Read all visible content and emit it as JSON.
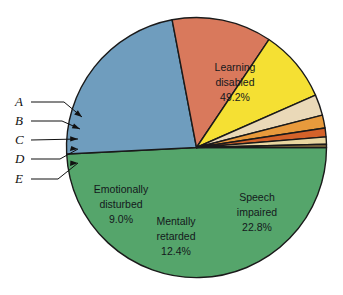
{
  "chart_data": {
    "type": "pie",
    "title": "",
    "subtitle": "",
    "xlabel": "",
    "ylabel": "",
    "legend_position": "callout-left",
    "grid": false,
    "units": "percent",
    "total": 100.0,
    "start_angle_deg": 0,
    "direction": "clockwise",
    "categories": [
      "Learning disabled",
      "Speech impaired",
      "Mentally retarded",
      "Emotionally disturbed",
      "E",
      "D",
      "C",
      "B",
      "A"
    ],
    "values": [
      49.2,
      22.8,
      12.4,
      9.0,
      2.6,
      1.6,
      1.1,
      0.9,
      0.4
    ],
    "colors": [
      "#55a56b",
      "#6f9dbe",
      "#d9795c",
      "#f5e033",
      "#ead9b8",
      "#e89a3c",
      "#d4622a",
      "#e8d6a0",
      "#8a7240"
    ],
    "slices": [
      {
        "id": "learning-disabled",
        "label": "Learning disabled",
        "label_line1": "Learning",
        "label_line2": "disabled",
        "value": 49.2,
        "value_label": "49.2%",
        "color": "#55a56b",
        "labeled_inside": true
      },
      {
        "id": "speech-impaired",
        "label": "Speech impaired",
        "label_line1": "Speech",
        "label_line2": "impaired",
        "value": 22.8,
        "value_label": "22.8%",
        "color": "#6f9dbe",
        "labeled_inside": true
      },
      {
        "id": "mentally-retarded",
        "label": "Mentally retarded",
        "label_line1": "Mentally",
        "label_line2": "retarded",
        "value": 12.4,
        "value_label": "12.4%",
        "color": "#d9795c",
        "labeled_inside": true
      },
      {
        "id": "emotionally-disturbed",
        "label": "Emotionally disturbed",
        "label_line1": "Emotionally",
        "label_line2": "disturbed",
        "value": 9.0,
        "value_label": "9.0%",
        "color": "#f5e033",
        "labeled_inside": true
      },
      {
        "id": "slice-e",
        "label": "E",
        "value": 2.6,
        "value_label": "",
        "color": "#ead9b8",
        "labeled_inside": false
      },
      {
        "id": "slice-d",
        "label": "D",
        "value": 1.6,
        "value_label": "",
        "color": "#e89a3c",
        "labeled_inside": false
      },
      {
        "id": "slice-c",
        "label": "C",
        "value": 1.1,
        "value_label": "",
        "color": "#d4622a",
        "labeled_inside": false
      },
      {
        "id": "slice-b",
        "label": "B",
        "value": 0.9,
        "value_label": "",
        "color": "#e8d6a0",
        "labeled_inside": false
      },
      {
        "id": "slice-a",
        "label": "A",
        "value": 0.4,
        "value_label": "",
        "color": "#8a7240",
        "labeled_inside": false
      }
    ]
  },
  "callouts": {
    "letters": [
      "A",
      "B",
      "C",
      "D",
      "E"
    ]
  },
  "inside_labels": {
    "learning": {
      "line1": "Learning",
      "line2": "disabled",
      "line3": "49.2%"
    },
    "speech": {
      "line1": "Speech",
      "line2": "impaired",
      "line3": "22.8%"
    },
    "mentally": {
      "line1": "Mentally",
      "line2": "retarded",
      "line3": "12.4%"
    },
    "emotionally": {
      "line1": "Emotionally",
      "line2": "disturbed",
      "line3": "9.0%"
    }
  },
  "geometry": {
    "cx": 196.5,
    "cy": 147.5,
    "r": 130
  }
}
